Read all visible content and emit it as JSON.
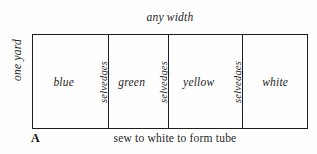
{
  "diagram": {
    "figure_label": "A",
    "top_caption": "any width",
    "left_caption": "one yard",
    "bottom_caption": "sew to white to form tube",
    "selvedge_label": "selvedges",
    "colors": {
      "ink": "#1d1d1d",
      "paper": "#fefefe"
    },
    "panels": [
      {
        "label": "blue",
        "has_selvedge": true,
        "width_px": 76
      },
      {
        "label": "green",
        "has_selvedge": true,
        "width_px": 60
      },
      {
        "label": "yellow",
        "has_selvedge": true,
        "width_px": 75
      },
      {
        "label": "white",
        "has_selvedge": false,
        "width_px": 65
      }
    ]
  }
}
